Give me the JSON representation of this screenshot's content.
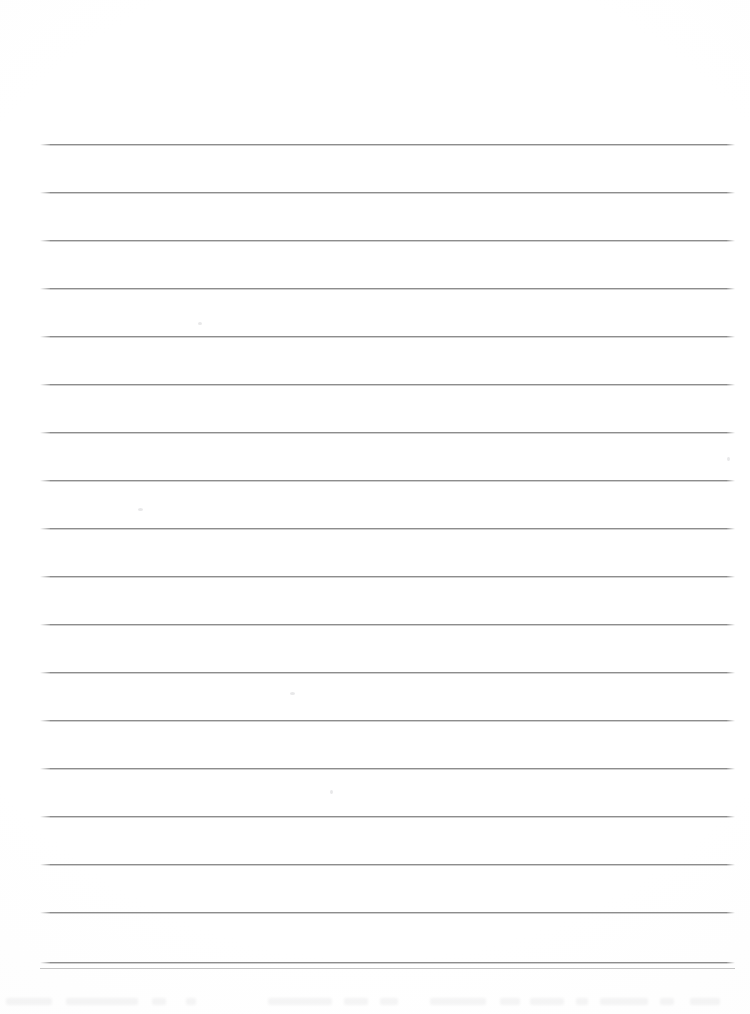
{
  "document": {
    "kind": "scanned-ruled-notebook-page",
    "title": "Blank Ruled Page",
    "orientation": "portrait",
    "page_width": 750,
    "page_height": 1014,
    "background_color": "#ffffff",
    "content_text": "",
    "is_blank": "true"
  },
  "ruling": {
    "line_color": "#8d8d8d",
    "line_shadow_color": "#bebebe",
    "line_thickness": 1,
    "line_count": 18,
    "left_x": 40,
    "right_x": 735,
    "line_width": 695,
    "first_line_y": 144,
    "line_spacing": 48,
    "line_y_positions": [
      144,
      192,
      240,
      288,
      336,
      384,
      432,
      480,
      528,
      576,
      624,
      672,
      720,
      768,
      816,
      864,
      912,
      962
    ]
  },
  "margins": {
    "top_margin_height": 144,
    "bottom_margin_height": 52,
    "left_margin_width": 40,
    "right_margin_width": 15
  },
  "artifacts": {
    "label": "scan-specks",
    "specks": [
      {
        "x": 198,
        "y": 322,
        "w": 4,
        "h": 3
      },
      {
        "x": 138,
        "y": 508,
        "w": 5,
        "h": 3
      },
      {
        "x": 727,
        "y": 457,
        "w": 3,
        "h": 4
      },
      {
        "x": 290,
        "y": 692,
        "w": 5,
        "h": 3
      },
      {
        "x": 330,
        "y": 790,
        "w": 3,
        "h": 4
      }
    ],
    "bleed_band": {
      "y": 996,
      "opacity": "0.055",
      "marks": [
        {
          "x": 6,
          "w": 46
        },
        {
          "x": 66,
          "w": 72
        },
        {
          "x": 152,
          "w": 14
        },
        {
          "x": 186,
          "w": 10
        },
        {
          "x": 268,
          "w": 64
        },
        {
          "x": 344,
          "w": 24
        },
        {
          "x": 380,
          "w": 18
        },
        {
          "x": 430,
          "w": 56
        },
        {
          "x": 500,
          "w": 20
        },
        {
          "x": 530,
          "w": 34
        },
        {
          "x": 576,
          "w": 12
        },
        {
          "x": 600,
          "w": 48
        },
        {
          "x": 660,
          "w": 14
        },
        {
          "x": 690,
          "w": 30
        }
      ]
    },
    "bottom_seam_y": 968
  }
}
